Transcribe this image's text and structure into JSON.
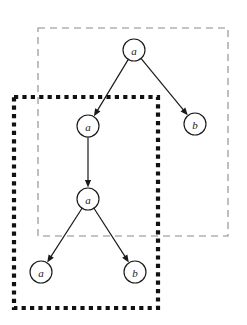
{
  "figure": {
    "background_color": "#ffffff",
    "width": 247,
    "height": 325
  },
  "tree": {
    "node_radius": 11,
    "node_stroke_color": "#1a1a1a",
    "node_fill_color": "#ffffff",
    "edge_color": "#1a1a1a",
    "nodes": [
      {
        "id": "n0",
        "label": "a",
        "x": 134,
        "y": 50,
        "level": 0,
        "name": "node-root-a"
      },
      {
        "id": "n1",
        "label": "a",
        "x": 88,
        "y": 126,
        "level": 1,
        "name": "node-level1-a"
      },
      {
        "id": "n2",
        "label": "b",
        "x": 195,
        "y": 124,
        "level": 1,
        "name": "node-level1-b"
      },
      {
        "id": "n3",
        "label": "a",
        "x": 88,
        "y": 199,
        "level": 2,
        "name": "node-level2-a"
      },
      {
        "id": "n4",
        "label": "a",
        "x": 41,
        "y": 272,
        "level": 3,
        "name": "node-leaf-a"
      },
      {
        "id": "n5",
        "label": "b",
        "x": 135,
        "y": 272,
        "level": 3,
        "name": "node-leaf-b"
      }
    ],
    "edges": [
      {
        "from": "n0",
        "to": "n1",
        "name": "edge-root-to-level1-a",
        "arrow": true
      },
      {
        "from": "n0",
        "to": "n2",
        "name": "edge-root-to-level1-b",
        "arrow": true
      },
      {
        "from": "n1",
        "to": "n3",
        "name": "edge-level1-a-to-level2-a",
        "arrow": true
      },
      {
        "from": "n3",
        "to": "n4",
        "name": "edge-level2-a-to-leaf-a",
        "arrow": true
      },
      {
        "from": "n3",
        "to": "n5",
        "name": "edge-level2-a-to-leaf-b",
        "arrow": true
      }
    ]
  },
  "regions": [
    {
      "id": "r-dashed",
      "name": "region-dashed-outer",
      "style": "dashed",
      "color": "#8a8a8a",
      "x": 38,
      "y": 28,
      "width": 190,
      "height": 208
    },
    {
      "id": "r-dotted",
      "name": "region-dotted-inner",
      "style": "dotted",
      "color": "#111111",
      "x": 14,
      "y": 97,
      "width": 144,
      "height": 211
    }
  ]
}
